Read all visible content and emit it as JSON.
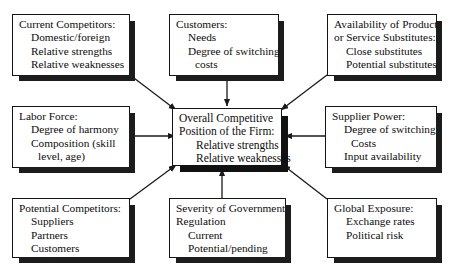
{
  "diagram": {
    "type": "influence-diagram",
    "background_color": "#ffffff",
    "box_border_color": "#141414",
    "box_shadow_color": "#1c1c1c",
    "arrow_color": "#1a1a1a",
    "nodes": [
      {
        "id": "current-competitors",
        "position": "top-left",
        "heading": "Current Competitors:",
        "items": [
          "Domestic/foreign",
          "Relative strengths",
          "Relative weaknesses"
        ]
      },
      {
        "id": "customers",
        "position": "top-center",
        "heading": "Customers:",
        "items": [
          "Needs",
          "Degree of switching",
          "costs"
        ]
      },
      {
        "id": "substitutes",
        "position": "top-right",
        "heading": "Availability of Product",
        "heading2": "or Service Substitutes:",
        "items": [
          "Close substitutes",
          "Potential substitutes"
        ]
      },
      {
        "id": "labor-force",
        "position": "middle-left",
        "heading": "Labor Force:",
        "items": [
          "Degree of harmony",
          "Composition (skill",
          "level, age)"
        ]
      },
      {
        "id": "center",
        "position": "middle-center",
        "heading": "Overall Competitive",
        "heading2": "Position of the Firm:",
        "items": [
          "Relative strengths",
          "Relative weaknesses"
        ]
      },
      {
        "id": "supplier-power",
        "position": "middle-right",
        "heading": "Supplier Power:",
        "items": [
          "Degree of switching",
          "Costs",
          "Input availability"
        ]
      },
      {
        "id": "potential-competitors",
        "position": "bottom-left",
        "heading": "Potential Competitors:",
        "items": [
          "Suppliers",
          "Partners",
          "Customers"
        ]
      },
      {
        "id": "government-regulation",
        "position": "bottom-center",
        "heading": "Severity of Government",
        "heading2": "Regulation",
        "items": [
          "Current",
          "Potential/pending"
        ]
      },
      {
        "id": "global-exposure",
        "position": "bottom-right",
        "heading": "Global Exposure:",
        "items": [
          "Exchange rates",
          "Political risk"
        ]
      }
    ],
    "connections": [
      {
        "from": "current-competitors",
        "to": "center",
        "style": "diagonal-arrow"
      },
      {
        "from": "customers",
        "to": "center",
        "style": "vertical-arrow"
      },
      {
        "from": "substitutes",
        "to": "center",
        "style": "diagonal-arrow"
      },
      {
        "from": "labor-force",
        "to": "center",
        "style": "horizontal-arrow"
      },
      {
        "from": "supplier-power",
        "to": "center",
        "style": "horizontal-arrow"
      },
      {
        "from": "potential-competitors",
        "to": "center",
        "style": "diagonal-arrow"
      },
      {
        "from": "government-regulation",
        "to": "center",
        "style": "vertical-arrow"
      },
      {
        "from": "global-exposure",
        "to": "center",
        "style": "diagonal-arrow"
      }
    ]
  }
}
